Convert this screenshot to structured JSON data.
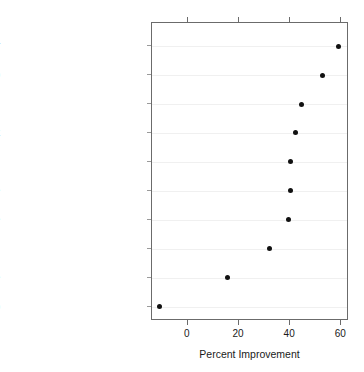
{
  "caption": {
    "left_fragment": "•",
    "right_fragment": "·"
  },
  "chart_data": {
    "type": "scatter",
    "subtype": "dot-plot",
    "title": "",
    "xlabel": "Percent Improvement",
    "ylabel": "",
    "xlim": [
      -14,
      63
    ],
    "xticks": [
      0,
      20,
      40,
      60
    ],
    "xtick_labels": [
      "0",
      "20",
      "40",
      "60"
    ],
    "grid": "horizontal-faint",
    "legend": "none",
    "marker": "filled-circle",
    "marker_color": "#111111",
    "categories": [
      "Program the CD player",
      "Connect a stereo",
      "Listen to a song on a CD",
      "Set the clock",
      "Set the timer to record",
      "Record on one side of a tape",
      "Create a mixed tape",
      "Program radio stations",
      "Listen to a tape",
      "Listen to the radio"
    ],
    "values": [
      59,
      52.5,
      44.5,
      42,
      40,
      40,
      39.5,
      32,
      15.5,
      -11
    ],
    "order": "descending-top-to-bottom"
  },
  "colors": {
    "panel_border": "#6b6b6b",
    "gridline": "#f0f0f0",
    "marker": "#111111",
    "text": "#1a1a1a"
  }
}
